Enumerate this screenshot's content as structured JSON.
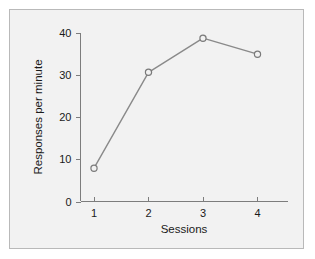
{
  "chart_data": {
    "type": "line",
    "title": "",
    "subtitle": "",
    "xlabel": "Sessions",
    "ylabel": "Responses per minute",
    "x": [
      1,
      2,
      3,
      4
    ],
    "values": [
      7.9,
      30.7,
      38.8,
      35.0
    ],
    "categories": [
      "1",
      "2",
      "3",
      "4"
    ],
    "xticklabels": [
      "1",
      "2",
      "3",
      "4"
    ],
    "yticklabels": [
      "0",
      "10",
      "20",
      "30",
      "40"
    ],
    "yticks": [
      0,
      10,
      20,
      30,
      40
    ],
    "xticks": [
      1,
      2,
      3,
      4
    ],
    "xlim": [
      0.55,
      4.6
    ],
    "ylim": [
      0,
      41
    ],
    "grid": false,
    "legend": null,
    "marker": "open-circle",
    "line_color": "#8a8a8a",
    "marker_edge_color": "#7a7a7a",
    "marker_face_color": "#f2f2f2",
    "axis_color": "#7d7d7d",
    "panel_background": "#f2f2f2",
    "figure_background": "#ffffff",
    "text_color": "#1a1a1a",
    "annotations": []
  },
  "ticks": {
    "y": [
      {
        "label": "0",
        "value": 0
      },
      {
        "label": "10",
        "value": 10
      },
      {
        "label": "20",
        "value": 20
      },
      {
        "label": "30",
        "value": 30
      },
      {
        "label": "40",
        "value": 40
      }
    ],
    "x": [
      {
        "label": "1",
        "value": 1
      },
      {
        "label": "2",
        "value": 2
      },
      {
        "label": "3",
        "value": 3
      },
      {
        "label": "4",
        "value": 4
      }
    ]
  },
  "points": [
    {
      "x": 1,
      "y": 7.9
    },
    {
      "x": 2,
      "y": 30.7
    },
    {
      "x": 3,
      "y": 38.8
    },
    {
      "x": 4,
      "y": 35.0
    }
  ]
}
